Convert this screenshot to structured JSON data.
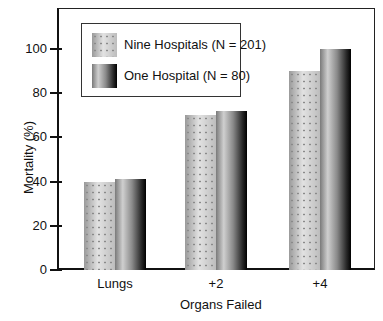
{
  "chart_data": {
    "type": "bar",
    "title": "",
    "xlabel": "Organs Failed",
    "ylabel": "Mortality (%)",
    "categories": [
      "Lungs",
      "+2",
      "+4"
    ],
    "series": [
      {
        "name": "Nine Hospitals (N = 201)",
        "values": [
          40,
          70,
          90
        ]
      },
      {
        "name": "One Hospital (N = 80)",
        "values": [
          41,
          72,
          100
        ]
      }
    ],
    "yticks": [
      "0",
      "20",
      "40",
      "60",
      "80",
      "100"
    ],
    "ylim": [
      0,
      115
    ],
    "grid": false,
    "legend_position": "upper left inside"
  }
}
